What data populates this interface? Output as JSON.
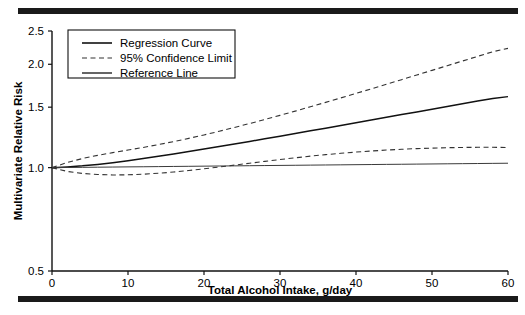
{
  "figure": {
    "rule_top_label": "top-rule",
    "rule_bottom_label": "bottom-rule"
  },
  "chart_data": {
    "type": "line",
    "title": "",
    "xlabel": "Total Alcohol Intake, g/day",
    "ylabel": "Multivariate Relative Risk",
    "xlim": [
      0,
      60
    ],
    "ylim": [
      0.5,
      2.5
    ],
    "yscale": "log",
    "grid": false,
    "xticks": [
      0,
      10,
      20,
      30,
      40,
      50,
      60
    ],
    "xticklabels": [
      "0",
      "10",
      "20",
      "30",
      "40",
      "50",
      "60"
    ],
    "yticks": [
      0.5,
      1.0,
      1.5,
      2.0,
      2.5
    ],
    "yticklabels": [
      "0.5",
      "1.0",
      "1.5",
      "2.0",
      "2.5"
    ],
    "legend_position": "upper-left",
    "x": [
      0,
      2,
      4,
      6,
      8,
      10,
      12,
      14,
      16,
      18,
      20,
      22,
      24,
      26,
      28,
      30,
      32,
      34,
      36,
      38,
      40,
      42,
      44,
      46,
      48,
      50,
      52,
      54,
      56,
      58,
      60
    ],
    "series": [
      {
        "name": "Regression Curve",
        "style": "solid",
        "color": "#111111",
        "values": [
          1.0,
          1.005,
          1.012,
          1.022,
          1.034,
          1.048,
          1.063,
          1.079,
          1.096,
          1.114,
          1.133,
          1.152,
          1.172,
          1.192,
          1.213,
          1.235,
          1.257,
          1.28,
          1.303,
          1.327,
          1.351,
          1.376,
          1.401,
          1.427,
          1.453,
          1.48,
          1.507,
          1.535,
          1.563,
          1.59,
          1.61
        ]
      },
      {
        "name": "95% Confidence Limit",
        "style": "dashed",
        "color": "#333333",
        "bound": "upper",
        "values": [
          1.0,
          1.035,
          1.063,
          1.086,
          1.106,
          1.125,
          1.145,
          1.167,
          1.191,
          1.217,
          1.245,
          1.276,
          1.309,
          1.344,
          1.381,
          1.42,
          1.461,
          1.504,
          1.549,
          1.596,
          1.645,
          1.696,
          1.749,
          1.804,
          1.861,
          1.92,
          1.981,
          2.044,
          2.109,
          2.176,
          2.225
        ]
      },
      {
        "name": "95% Confidence Limit",
        "style": "dashed",
        "color": "#333333",
        "bound": "lower",
        "values": [
          1.0,
          0.975,
          0.962,
          0.955,
          0.952,
          0.953,
          0.957,
          0.963,
          0.971,
          0.981,
          0.992,
          1.004,
          1.017,
          1.03,
          1.043,
          1.056,
          1.068,
          1.08,
          1.091,
          1.101,
          1.11,
          1.118,
          1.125,
          1.131,
          1.136,
          1.14,
          1.143,
          1.145,
          1.146,
          1.146,
          1.145
        ]
      },
      {
        "name": "Reference Line",
        "style": "solid-thin",
        "color": "#3a3a3a",
        "values": [
          1.0,
          1.001,
          1.002,
          1.003,
          1.004,
          1.005,
          1.006,
          1.007,
          1.008,
          1.009,
          1.01,
          1.011,
          1.012,
          1.013,
          1.014,
          1.015,
          1.016,
          1.017,
          1.018,
          1.019,
          1.02,
          1.021,
          1.022,
          1.023,
          1.024,
          1.025,
          1.026,
          1.027,
          1.028,
          1.029,
          1.03
        ]
      }
    ],
    "legend": [
      {
        "label": "Regression Curve",
        "style": "solid"
      },
      {
        "label": "95% Confidence Limit",
        "style": "dashed"
      },
      {
        "label": "Reference Line",
        "style": "solid-thin"
      }
    ]
  }
}
